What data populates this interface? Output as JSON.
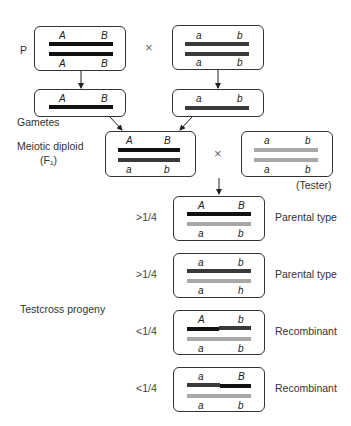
{
  "colors": {
    "dominant_chromosome": "#111111",
    "recessive_chromosome": "#3a3a3a",
    "tester_chromosome": "#a8a8a8",
    "border": "#333333"
  },
  "labels": {
    "p": "P",
    "gametes": "Gametes",
    "meiotic_diploid": "Meiotic diploid",
    "f1": "(F₁)",
    "tester": "(Tester)",
    "testcross_progeny": "Testcross progeny",
    "cross_symbol": "×"
  },
  "parents": {
    "left": {
      "top": [
        "A",
        "B"
      ],
      "bottom": [
        "A",
        "B"
      ]
    },
    "right": {
      "top": [
        "a",
        "b"
      ],
      "bottom": [
        "a",
        "b"
      ]
    }
  },
  "gametes": {
    "left": [
      "A",
      "B"
    ],
    "right": [
      "a",
      "b"
    ]
  },
  "f1": {
    "top": [
      "A",
      "B"
    ],
    "bottom": [
      "a",
      "b"
    ]
  },
  "tester": {
    "top": [
      "a",
      "b"
    ],
    "bottom": [
      "a",
      "b"
    ]
  },
  "progeny": [
    {
      "fraction": ">1/4",
      "top": [
        "A",
        "B"
      ],
      "bottom": [
        "a",
        "b"
      ],
      "type": "Parental type"
    },
    {
      "fraction": ">1/4",
      "top": [
        "a",
        "b"
      ],
      "bottom": [
        "a",
        "h"
      ],
      "type": "Parental type"
    },
    {
      "fraction": "<1/4",
      "top": [
        "A",
        "b"
      ],
      "bottom": [
        "a",
        "b"
      ],
      "type": "Recombinant"
    },
    {
      "fraction": "<1/4",
      "top": [
        "a",
        "B"
      ],
      "bottom": [
        "a",
        "b"
      ],
      "type": "Recombinant"
    }
  ]
}
